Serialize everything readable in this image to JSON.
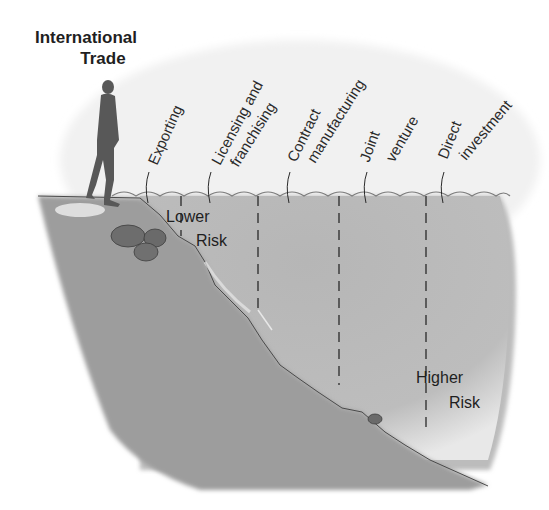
{
  "title": {
    "line1": "International",
    "line2": "Trade"
  },
  "entry_modes": [
    {
      "id": "exporting",
      "lines": [
        "Exporting"
      ]
    },
    {
      "id": "licensing",
      "lines": [
        "Licensing and",
        "franchising"
      ]
    },
    {
      "id": "contract",
      "lines": [
        "Contract",
        "manufacturing"
      ]
    },
    {
      "id": "joint",
      "lines": [
        "Joint",
        "venture"
      ]
    },
    {
      "id": "direct",
      "lines": [
        "Direct",
        "investment"
      ]
    }
  ],
  "risk_labels": {
    "low": {
      "line1": "Lower",
      "line2": "Risk"
    },
    "high": {
      "line1": "Higher",
      "line2": "Risk"
    }
  },
  "colors": {
    "water": "#b8b8b8",
    "ground": "#9e9e9e",
    "text": "#1a1a1a",
    "figure": "#555555"
  }
}
